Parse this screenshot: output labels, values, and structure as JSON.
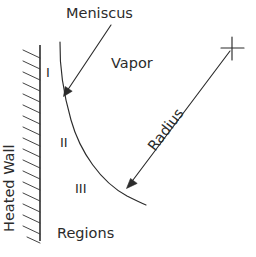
{
  "diagram": {
    "labels": {
      "meniscus": "Meniscus",
      "vapor": "Vapor",
      "radius": "Radius",
      "heated_wall": "Heated Wall",
      "regions": "Regions",
      "region_one": "I",
      "region_two": "II",
      "region_three": "III"
    },
    "colors": {
      "ink": "#2b2b2b",
      "background": "#ffffff"
    },
    "geometry": {
      "wall_x": 40,
      "wall_top_y": 45,
      "wall_bottom_y": 240,
      "hatch_count": 17,
      "meniscus_curve": "M 60 42 C 60 70, 64 96, 78 138 C 92 176, 118 198, 145 206",
      "meniscus_arrow": "M 110 26 L 66 92",
      "radius_arrow": "M 230 50 L 129 185",
      "plus_marker_x": 232,
      "plus_marker_y": 48
    }
  }
}
